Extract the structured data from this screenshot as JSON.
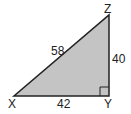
{
  "diagram": {
    "type": "right-triangle",
    "fill_color": "#c4c4c4",
    "stroke_color": "#222222",
    "vertices": [
      {
        "name": "X",
        "label": "X"
      },
      {
        "name": "Y",
        "label": "Y"
      },
      {
        "name": "Z",
        "label": "Z"
      }
    ],
    "sides": {
      "XZ": "58",
      "XY": "42",
      "YZ": "40"
    },
    "right_angle_at": "Y"
  }
}
